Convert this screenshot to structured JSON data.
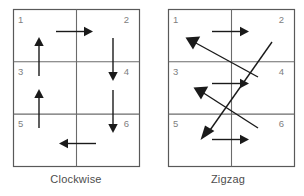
{
  "figure": {
    "panels": [
      {
        "id": "clockwise",
        "caption": "Clockwise",
        "cells": [
          "1",
          "2",
          "3",
          "4",
          "5",
          "6"
        ],
        "grid": {
          "cols": 2,
          "rows": 3
        },
        "arrows": [
          {
            "name": "arrow-1-to-2",
            "type": "straight",
            "direction": "right",
            "x1": 43,
            "y1": 22,
            "x2": 77,
            "y2": 22
          },
          {
            "name": "arrow-2-to-4",
            "type": "straight",
            "direction": "down",
            "x1": 100,
            "y1": 28,
            "x2": 100,
            "y2": 69
          },
          {
            "name": "arrow-3-to-1",
            "type": "straight",
            "direction": "up",
            "x1": 26,
            "y1": 63,
            "x2": 26,
            "y2": 30
          },
          {
            "name": "arrow-4-to-6",
            "type": "straight",
            "direction": "down",
            "x1": 100,
            "y1": 80,
            "x2": 100,
            "y2": 121
          },
          {
            "name": "arrow-5-to-3",
            "type": "straight",
            "direction": "up",
            "x1": 26,
            "y1": 115,
            "x2": 26,
            "y2": 82
          },
          {
            "name": "arrow-6-to-5",
            "type": "straight",
            "direction": "left",
            "x1": 77,
            "y1": 128,
            "x2": 43,
            "y2": 128
          }
        ]
      },
      {
        "id": "zigzag",
        "caption": "Zigzag",
        "cells": [
          "1",
          "2",
          "3",
          "4",
          "5",
          "6"
        ],
        "grid": {
          "cols": 2,
          "rows": 3
        },
        "arrows": [
          {
            "name": "arrow-row1-right",
            "type": "straight",
            "direction": "right",
            "x1": 50,
            "y1": 22,
            "x2": 88,
            "y2": 22
          },
          {
            "name": "arrow-row2-right",
            "type": "straight",
            "direction": "right",
            "x1": 50,
            "y1": 73,
            "x2": 88,
            "y2": 73
          },
          {
            "name": "arrow-row3-right",
            "type": "straight",
            "direction": "right",
            "x1": 50,
            "y1": 124,
            "x2": 88,
            "y2": 124
          },
          {
            "name": "arrow-diag-2-to-3",
            "type": "diagonal",
            "direction": "up-left",
            "x1": 96,
            "y1": 72,
            "x2": 38,
            "y2": 30
          },
          {
            "name": "arrow-diag-4-to-5",
            "type": "diagonal",
            "direction": "up-left",
            "x1": 96,
            "y1": 122,
            "x2": 38,
            "y2": 80
          }
        ]
      }
    ]
  },
  "colors": {
    "grid_line": "#6b6b6b",
    "grid_frame": "#595959",
    "arrow": "#1a1a1a",
    "cell_number": "#808080",
    "caption": "#4d4d4d",
    "background": "#ffffff"
  }
}
